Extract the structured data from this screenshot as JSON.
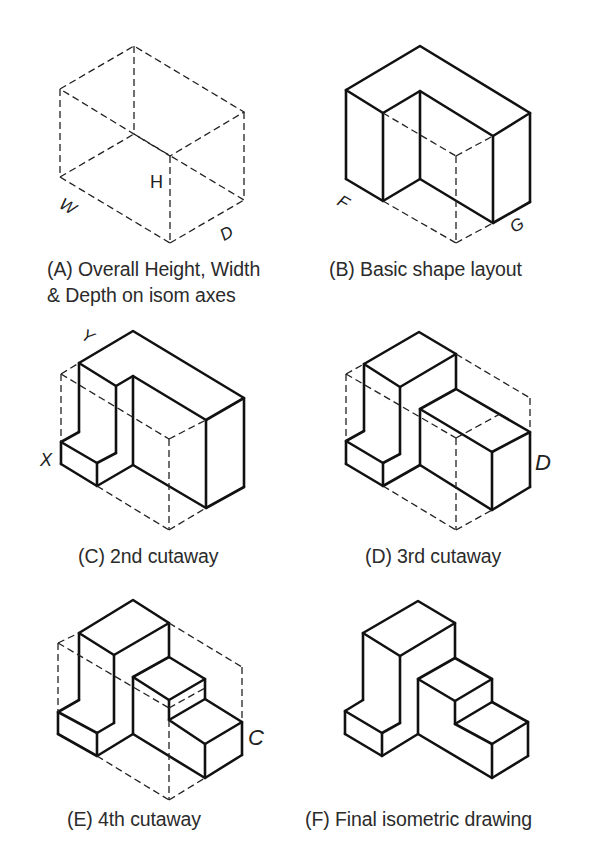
{
  "figure": {
    "panels": [
      {
        "id": "A",
        "caption_line1": "(A) Overall Height, Width",
        "caption_line2": "& Depth on isom axes",
        "labels": {
          "height": "H",
          "width": "W",
          "depth": "D"
        }
      },
      {
        "id": "B",
        "caption": "(B) Basic shape layout",
        "labels": {
          "left_corner": "F",
          "right_corner": "G"
        }
      },
      {
        "id": "C",
        "caption": "(C) 2nd cutaway",
        "labels": {
          "step": "X",
          "top": "Y"
        }
      },
      {
        "id": "D",
        "caption": "(D) 3rd cutaway",
        "labels": {
          "side": "D"
        }
      },
      {
        "id": "E",
        "caption": "(E) 4th cutaway",
        "labels": {
          "side": "C"
        }
      },
      {
        "id": "F",
        "caption": "(F) Final isometric drawing"
      }
    ]
  }
}
